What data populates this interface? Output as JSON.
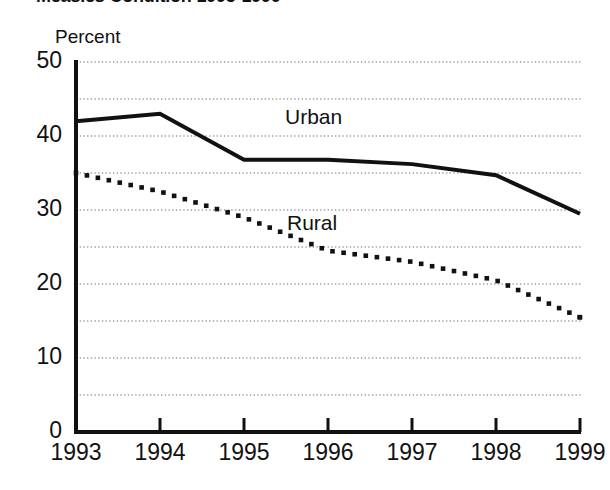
{
  "chart_data": {
    "type": "line",
    "title": "Measles Condition 1993-1999",
    "subtitle": "",
    "xlabel": "",
    "ylabel": "Percent",
    "unit_caption": "Percent",
    "x": [
      1993,
      1994,
      1995,
      1996,
      1997,
      1998,
      1999
    ],
    "categories": [
      "1993",
      "1994",
      "1995",
      "1996",
      "1997",
      "1998",
      "1999"
    ],
    "series": [
      {
        "name": "Urban",
        "style": "solid",
        "color": "#111111",
        "values": [
          42.0,
          43.0,
          36.8,
          36.8,
          36.2,
          34.7,
          29.5
        ]
      },
      {
        "name": "Rural",
        "style": "dotted",
        "color": "#111111",
        "values": [
          35.0,
          32.5,
          29.0,
          24.5,
          23.0,
          20.5,
          15.5
        ]
      }
    ],
    "ylim": [
      0,
      50
    ],
    "xlim": [
      1993,
      1999
    ],
    "yticks": [
      0,
      10,
      20,
      30,
      40,
      50
    ],
    "ytick_labels": [
      "0",
      "10",
      "20",
      "30",
      "40",
      "50"
    ],
    "xtick_labels": [
      "1993",
      "1994",
      "1995",
      "1996",
      "1997",
      "1998",
      "1999"
    ],
    "gridlines": {
      "enabled": true,
      "orientation": "horizontal",
      "style": "dotted",
      "interval": 5,
      "values": [
        5,
        10,
        15,
        20,
        25,
        30,
        35,
        40,
        45,
        50
      ]
    },
    "legend": {
      "position": "inline-annotations",
      "entries": [
        "Urban",
        "Rural"
      ]
    },
    "annotations": [
      {
        "text": "Urban",
        "series": "Urban"
      },
      {
        "text": "Rural",
        "series": "Rural"
      }
    ],
    "colors": {
      "axis": "#111111",
      "grid": "#9a9a9a",
      "background": "#ffffff",
      "urban": "#111111",
      "rural": "#111111"
    }
  }
}
